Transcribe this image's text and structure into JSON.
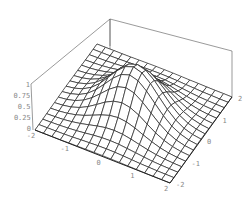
{
  "chart_data": {
    "type": "surface3d",
    "title": "",
    "function": "exp(-(x^2 + y^2))",
    "x_range": [
      -2,
      2
    ],
    "y_range": [
      -2,
      2
    ],
    "z_range": [
      0,
      1
    ],
    "grid_steps": 16,
    "x_ticks": [
      "-2",
      "-1",
      "0",
      "1",
      "2"
    ],
    "y_ticks": [
      "-2",
      "-1",
      "0",
      "1",
      "2"
    ],
    "z_ticks": [
      "0",
      "0.25",
      "0.5",
      "0.75",
      "1"
    ],
    "xlabel": "",
    "ylabel": "",
    "zlabel": "",
    "box": true,
    "colors": {
      "mesh_line": "#222222",
      "mesh_fill": "#ffffff",
      "box_line": "#555555",
      "tick_text": "#888888"
    }
  },
  "projection": {
    "base_front_left": [
      35,
      130
    ],
    "base_front": [
      170,
      183
    ],
    "base_right": [
      232,
      97
    ],
    "z_scale_px": 48,
    "box_top_back": [
      110,
      19
    ],
    "box_top_right": [
      232,
      51
    ],
    "box_top_left": [
      31,
      84
    ]
  }
}
